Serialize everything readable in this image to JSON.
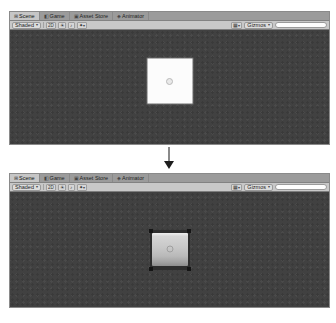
{
  "editor": {
    "tabs": [
      {
        "icon": "⊞",
        "label": "Scene"
      },
      {
        "icon": "◧",
        "label": "Game"
      },
      {
        "icon": "▣",
        "label": "Asset Store"
      },
      {
        "icon": "◈",
        "label": "Animator"
      }
    ],
    "toolbar": {
      "draw_mode": "Shaded",
      "caret": "▾",
      "toggle_2d": "2D",
      "icons": {
        "lighting": "☀",
        "audio": "♪",
        "effects": "✦",
        "grid": "▦"
      },
      "gizmos": "Gizmos",
      "search_value": ""
    },
    "colors": {
      "scene_background": "#414141",
      "tabbar": "#9b9b9b",
      "tab_active": "#c6c6c6",
      "toolbar": "#c8c8c8"
    }
  },
  "scenes": {
    "before": {
      "object": "white-square-sprite"
    },
    "after": {
      "object": "gray-tile-sprite"
    }
  }
}
